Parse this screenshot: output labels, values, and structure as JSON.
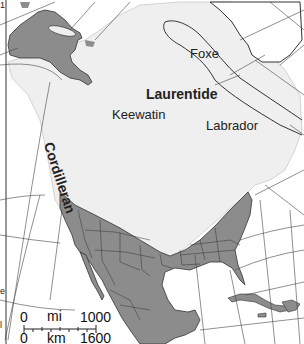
{
  "map": {
    "title": "Glacial ice sheets of North America",
    "colors": {
      "ice": "#efefef",
      "ice_free_land": "#8c8c8c",
      "water": "#ffffff",
      "border": "#333333",
      "grid": "#444444"
    },
    "labels": {
      "foxe": "Foxe",
      "laurentide": "Laurentide",
      "keewatin": "Keewatin",
      "labrador": "Labrador",
      "cordilleran": "Cordilleran"
    },
    "scale_bar": {
      "mi_zero": "0",
      "mi_unit": "mi",
      "mi_max": "1000",
      "km_zero": "0",
      "km_unit": "km",
      "km_max": "1600"
    },
    "edge_marks": {
      "top_left": "1",
      "left_mid": "e",
      "left_low": "l"
    }
  }
}
